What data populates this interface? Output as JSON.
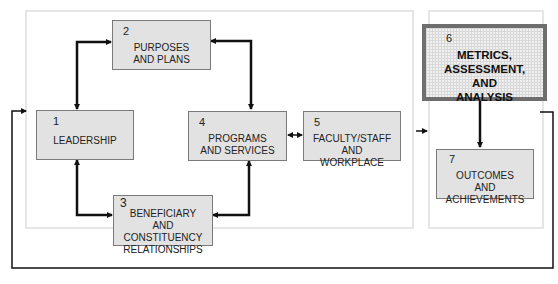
{
  "diagram": {
    "boxes": [
      {
        "id": "1",
        "num": "1",
        "label": "LEADERSHIP"
      },
      {
        "id": "2",
        "num": "2",
        "label": "PURPOSES AND PLANS"
      },
      {
        "id": "3",
        "num": "3",
        "label": "BENEFICIARY AND CONSTITUENCY RELATIONSHIPS"
      },
      {
        "id": "4",
        "num": "4",
        "label": "PROGRAMS AND SERVICES"
      },
      {
        "id": "5",
        "num": "5",
        "label": "FACULTY/STAFF AND WORKPLACE"
      },
      {
        "id": "6",
        "num": "6",
        "label": "METRICS, ASSESSMENT, AND ANALYSIS"
      },
      {
        "id": "7",
        "num": "7",
        "label": "OUTCOMES AND ACHIEVEMENTS"
      }
    ],
    "connections": [
      {
        "from": "1",
        "to": "2",
        "type": "bidirectional"
      },
      {
        "from": "2",
        "to": "4",
        "type": "bidirectional"
      },
      {
        "from": "1",
        "to": "3",
        "type": "bidirectional"
      },
      {
        "from": "3",
        "to": "4",
        "type": "bidirectional"
      },
      {
        "from": "4",
        "to": "5",
        "type": "bidirectional"
      },
      {
        "from": "left-group",
        "to": "right-group",
        "type": "arrow"
      },
      {
        "from": "6",
        "to": "7",
        "type": "arrow"
      },
      {
        "from": "6",
        "to": "1",
        "type": "feedback-loop"
      }
    ],
    "colors": {
      "box_fill": "#e2e2e2",
      "box_border": "#7a7a7a",
      "highlight_border": "#6e6e6e",
      "container_border": "#e6e6e6",
      "arrow": "#111111"
    }
  }
}
